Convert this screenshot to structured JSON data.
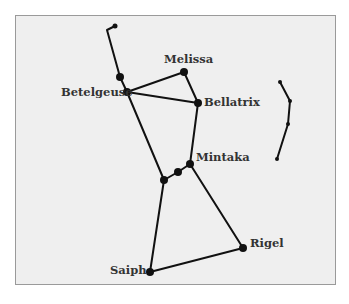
{
  "diagram": {
    "colors": {
      "background": "#efefef",
      "border": "#9a9a9a",
      "lines": "#111111",
      "text": "#333333"
    },
    "stars": [
      {
        "id": "club-tip",
        "x": 115,
        "y": 26,
        "r": 2.5
      },
      {
        "id": "club-mid",
        "x": 120,
        "y": 77,
        "r": 4
      },
      {
        "id": "betelgeuse",
        "label": "Betelgeuse",
        "x": 127,
        "y": 92,
        "r": 4
      },
      {
        "id": "melissa",
        "label": "Melissa",
        "x": 184,
        "y": 72,
        "r": 4
      },
      {
        "id": "bellatrix",
        "label": "Bellatrix",
        "x": 198,
        "y": 103,
        "r": 4
      },
      {
        "id": "mintaka",
        "label": "Mintaka",
        "x": 190,
        "y": 164,
        "r": 4
      },
      {
        "id": "alnilam",
        "x": 178,
        "y": 172,
        "r": 4
      },
      {
        "id": "alnitak",
        "x": 164,
        "y": 180,
        "r": 4
      },
      {
        "id": "rigel",
        "label": "Rigel",
        "x": 243,
        "y": 248,
        "r": 4
      },
      {
        "id": "saiph",
        "label": "Saiph",
        "x": 150,
        "y": 272,
        "r": 4
      },
      {
        "id": "shield-1",
        "x": 280,
        "y": 82,
        "r": 2
      },
      {
        "id": "shield-2",
        "x": 290,
        "y": 101,
        "r": 2
      },
      {
        "id": "shield-3",
        "x": 288,
        "y": 124,
        "r": 2
      },
      {
        "id": "shield-4",
        "x": 277,
        "y": 159,
        "r": 2
      }
    ],
    "labels": {
      "melissa": "Melissa",
      "betelgeuse": "Betelgeuse",
      "bellatrix": "Bellatrix",
      "mintaka": "Mintaka",
      "rigel": "Rigel",
      "saiph": "Saiph"
    }
  }
}
